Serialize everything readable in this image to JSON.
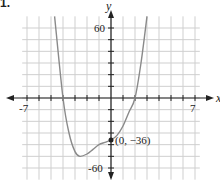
{
  "problem": {
    "label": "1."
  },
  "chart_data": {
    "type": "line",
    "title": "",
    "xlabel": "x",
    "ylabel": "y",
    "xlim": [
      -7,
      7
    ],
    "ylim": [
      -60,
      60
    ],
    "x_tick_labels": [
      "-7",
      "7"
    ],
    "y_tick_labels": [
      "60",
      "-60"
    ],
    "grid": true,
    "grid_step_x": 1,
    "grid_step_y": 10,
    "series": [
      {
        "name": "f(x)",
        "x": [
          -4.7,
          -4.0,
          -3.5,
          -3.0,
          -2.6,
          -2.0,
          -1.5,
          -1.0,
          -0.5,
          0.0,
          0.5,
          1.0,
          1.5,
          2.0,
          2.5,
          3.0
        ],
        "y": [
          70,
          0,
          -30,
          -46,
          -50,
          -48,
          -44,
          -40,
          -38,
          -36,
          -32,
          -24,
          -12,
          0,
          30,
          70
        ]
      }
    ],
    "annotations": [
      {
        "text": "(0, −36)",
        "x": 0,
        "y": -36,
        "marker": "point"
      }
    ],
    "colors": {
      "curve": "#8a8a8a",
      "grid": "#cfcfcf",
      "axes": "#222222"
    }
  }
}
